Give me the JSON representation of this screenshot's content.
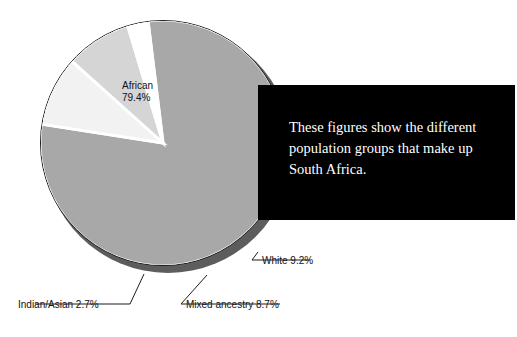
{
  "caption": {
    "text": "These figures show the different population groups that make up South Africa."
  },
  "labels": {
    "african": "African\n79.4%",
    "african_name": "African",
    "african_value": "79.4%",
    "white": "White 9.2%",
    "mixed": "Mixed ancestry 8.7%",
    "indian": "Indian/Asian 2.7%"
  },
  "colors": {
    "african_slice": "#a8a8a8",
    "white_slice": "#f2f2f2",
    "mixed_slice": "#d5d5d5",
    "indian_slice": "#ffffff",
    "separator": "#ffffff",
    "outline": "#1c1c1c",
    "drop_shadow": "#5d5d5d",
    "caption_background": "#000000",
    "caption_text": "#ffffff",
    "page_background": "#ffffff"
  },
  "chart_data": {
    "type": "pie",
    "title": "",
    "categories": [
      "African",
      "White",
      "Mixed ancestry",
      "Indian/Asian"
    ],
    "values": [
      79.4,
      9.2,
      8.7,
      2.7
    ],
    "unit": "%",
    "labels_shown": [
      "African 79.4%",
      "White 9.2%",
      "Mixed ancestry 8.7%",
      "Indian/Asian 2.7%"
    ],
    "legend": "none",
    "annotation": "These figures show the different population groups that make up South Africa."
  }
}
